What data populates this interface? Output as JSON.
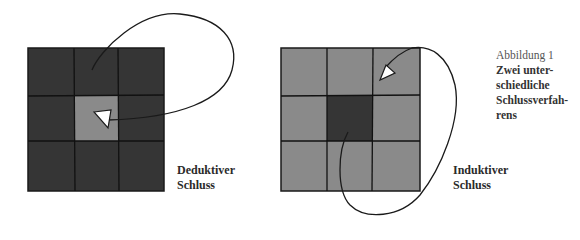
{
  "figure": {
    "caption": {
      "title": "Abbildung 1",
      "lines": [
        "Zwei unter-",
        "schiedliche",
        "Schlussverfah-",
        "rens"
      ]
    }
  },
  "panels": [
    {
      "name": "deductive",
      "label_lines": [
        "Deduktiver",
        "Schluss"
      ],
      "grid": "3x3",
      "outer_color": "#353535",
      "center_color": "#8a8a8a",
      "arrow": "from top-middle cell, looping out right, pointing into center cell"
    },
    {
      "name": "inductive",
      "label_lines": [
        "Induktiver",
        "Schluss"
      ],
      "grid": "3x3",
      "outer_color": "#8a8a8a",
      "center_color": "#353535",
      "arrow": "from center cell, looping down and out right, pointing into top-right cell"
    }
  ],
  "colors": {
    "dark": "#353535",
    "light": "#8a8a8a",
    "line": "#1a1a1a"
  }
}
